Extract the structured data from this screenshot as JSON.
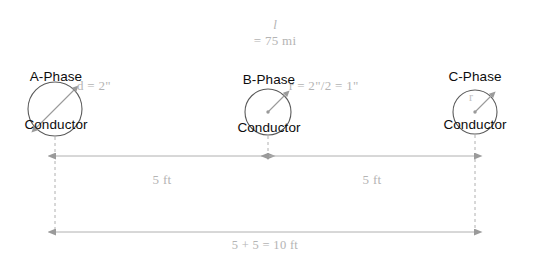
{
  "diagram": {
    "type": "three-phase-conductor-spacing",
    "line_length_label": "l = 75 mi",
    "line_length_variable": "l",
    "line_length_value": "= 75 mi",
    "conductors": [
      {
        "id": "a-phase",
        "name_line1": "A-Phase",
        "name_line2": "Conductor",
        "dimension_label": "d = 2\"",
        "dimension_kind": "diameter",
        "center_x": 55,
        "center_y": 109,
        "radius_px": 27
      },
      {
        "id": "b-phase",
        "name_line1": "B-Phase",
        "name_line2": "Conductor",
        "dimension_label": "r = 2\"/2 = 1\"",
        "dimension_kind": "radius",
        "center_x": 268,
        "center_y": 112,
        "radius_px": 23
      },
      {
        "id": "c-phase",
        "name_line1": "C-Phase",
        "name_line2": "Conductor",
        "dimension_label": "r",
        "dimension_kind": "radius",
        "center_x": 475,
        "center_y": 112,
        "radius_px": 22
      }
    ],
    "dimensions": [
      {
        "id": "span-a-to-b",
        "label": "5 ft",
        "from": "a-phase",
        "to": "b-phase"
      },
      {
        "id": "span-b-to-c",
        "label": "5 ft",
        "from": "b-phase",
        "to": "c-phase"
      },
      {
        "id": "span-a-to-c-total",
        "label": "5 + 5 = 10 ft",
        "from": "a-phase",
        "to": "c-phase"
      }
    ],
    "colors": {
      "background": "#ffffff",
      "label_text": "#0d0d0d",
      "annotation_text": "#b4b4b4",
      "circle_stroke": "#5a5a5a",
      "dimension_line": "#b0b0b0",
      "dashed_line": "#b0b0b0",
      "arrow_fill": "#9a9a9a"
    }
  }
}
